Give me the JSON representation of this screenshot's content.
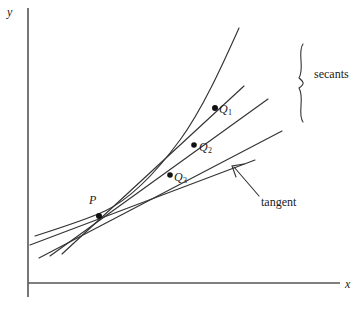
{
  "figure": {
    "width": 363,
    "height": 312,
    "background_color": "#ffffff",
    "ink_color": "#1a1a1a"
  },
  "axes": {
    "x_label": "x",
    "y_label": "y",
    "origin": {
      "x": 28,
      "y": 283
    },
    "x_axis": {
      "x1": 28,
      "y1": 283,
      "x2": 340,
      "y2": 283
    },
    "y_axis": {
      "x1": 28,
      "y1": 8,
      "x2": 28,
      "y2": 297
    },
    "color": "#555555"
  },
  "labels": {
    "point_P": "P",
    "point_Q1_base": "Q",
    "point_Q1_sub": "1",
    "point_Q2_base": "Q",
    "point_Q2_sub": "2",
    "point_Q3_base": "Q",
    "point_Q3_sub": "3",
    "secants": "secants",
    "tangent": "tangent"
  },
  "geometry": {
    "vertex": {
      "x": 105,
      "y": 211
    },
    "curve_path": "M 35,236 C 60,228 88,219 105,211 C 128,200 152,178 180,140 C 202,110 222,66 239,28",
    "points": [
      {
        "name": "P",
        "x": 99,
        "y": 216,
        "radius": 3.0
      },
      {
        "name": "Q1",
        "x": 215,
        "y": 108,
        "radius": 3.0
      },
      {
        "name": "Q2",
        "x": 194,
        "y": 145,
        "radius": 2.8
      },
      {
        "name": "Q3",
        "x": 170,
        "y": 175,
        "radius": 2.8
      }
    ],
    "secant_lines": [
      {
        "name": "secant-through-Q1",
        "x1": 62,
        "y1": 254,
        "x2": 244,
        "y2": 86
      },
      {
        "name": "secant-through-Q2",
        "x1": 50,
        "y1": 256,
        "x2": 268,
        "y2": 99
      },
      {
        "name": "secant-through-Q3",
        "x1": 39,
        "y1": 258,
        "x2": 282,
        "y2": 131
      }
    ],
    "tangent_line": {
      "name": "tangent-line",
      "x1": 30,
      "y1": 245,
      "x2": 255,
      "y2": 160
    },
    "brace": {
      "name": "secants-brace",
      "path": "M 303,44 C 297,52 305,68 299,78 C 304,82 305,84 299,88 C 305,98 297,114 303,122",
      "top": 44,
      "bottom": 122
    },
    "tangent_leader": {
      "name": "tangent-leader-line",
      "path": "M 259,196 L 234,167",
      "arrow_tip": {
        "x": 232,
        "y": 166
      },
      "arrow_wing_1": {
        "x": 244,
        "y": 164
      },
      "arrow_wing_2": {
        "x": 236,
        "y": 177
      }
    }
  }
}
